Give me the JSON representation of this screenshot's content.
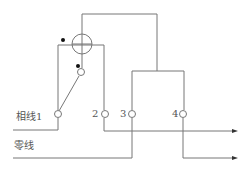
{
  "diagram": {
    "type": "electric-meter-wiring",
    "labels": {
      "phase_line": "相线1",
      "neutral_line": "零线",
      "terminal_2": "2",
      "terminal_3": "3",
      "terminal_4": "4"
    },
    "colors": {
      "line": "#777777",
      "dot": "#111111",
      "text": "#555555"
    }
  }
}
